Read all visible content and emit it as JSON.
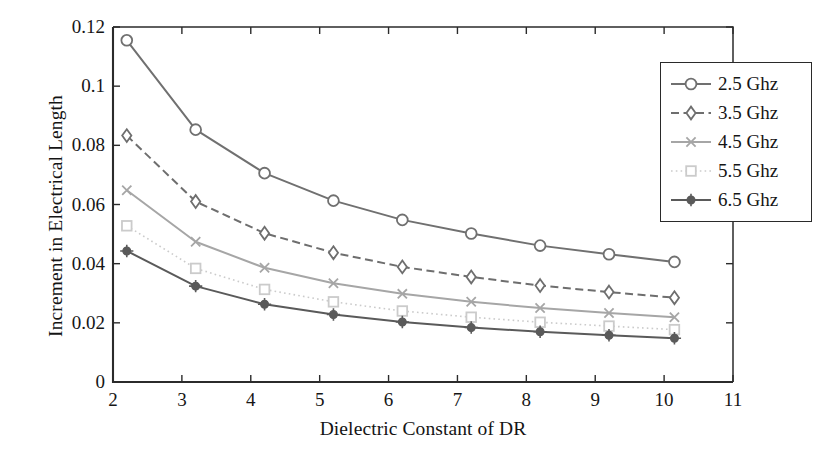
{
  "chart_data": {
    "type": "line",
    "title": "",
    "xlabel": "Dielectric Constant of DR",
    "ylabel": "Increment in Electrical Length",
    "xlim": [
      2,
      11
    ],
    "ylim": [
      0,
      0.12
    ],
    "xticks": [
      2,
      3,
      4,
      5,
      6,
      7,
      8,
      9,
      10,
      11
    ],
    "xtick_labels": [
      "2",
      "3",
      "4",
      "5",
      "6",
      "7",
      "8",
      "9",
      "10",
      "11"
    ],
    "yticks": [
      0,
      0.02,
      0.04,
      0.06,
      0.08,
      0.1,
      0.12
    ],
    "ytick_labels": [
      "0",
      "0.02",
      "0.04",
      "0.06",
      "0.08",
      "0.1",
      "0.12"
    ],
    "grid": false,
    "legend_position": "upper right",
    "x": [
      2.2,
      3.2,
      4.2,
      5.2,
      6.2,
      7.2,
      8.2,
      9.2,
      10.15
    ],
    "series": [
      {
        "name": "2.5 Ghz",
        "marker": "circle",
        "linestyle": "solid",
        "color": "#707070",
        "values": [
          0.1155,
          0.0853,
          0.0706,
          0.0613,
          0.0548,
          0.0502,
          0.0461,
          0.0432,
          0.0406
        ]
      },
      {
        "name": "3.5 Ghz",
        "marker": "diamond",
        "linestyle": "dashed",
        "color": "#6e6e6e",
        "values": [
          0.0833,
          0.061,
          0.0503,
          0.0437,
          0.0389,
          0.0355,
          0.0326,
          0.0304,
          0.0285
        ]
      },
      {
        "name": "4.5 Ghz",
        "marker": "x",
        "linestyle": "solid",
        "color": "#a6a6a6",
        "values": [
          0.0648,
          0.0474,
          0.0386,
          0.0334,
          0.0298,
          0.0271,
          0.025,
          0.0233,
          0.0219
        ]
      },
      {
        "name": "5.5 Ghz",
        "marker": "square",
        "linestyle": "dotted",
        "color": "#cbcbcb",
        "values": [
          0.0528,
          0.0384,
          0.0313,
          0.0271,
          0.024,
          0.0219,
          0.0202,
          0.0189,
          0.0177
        ]
      },
      {
        "name": "6.5 Ghz",
        "marker": "star-filled",
        "linestyle": "solid",
        "color": "#5a5a5a",
        "values": [
          0.0443,
          0.0324,
          0.0263,
          0.0228,
          0.0203,
          0.0184,
          0.017,
          0.0158,
          0.0148
        ]
      }
    ]
  },
  "axes": {
    "frame_color": "#2b2b2b"
  }
}
